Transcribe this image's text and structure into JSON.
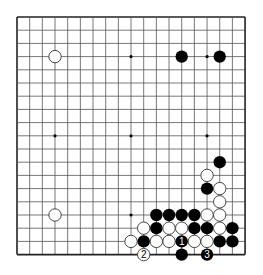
{
  "board": {
    "size": 19,
    "origin_x": 17,
    "origin_y": 17,
    "step_x": 12.67,
    "step_y": 13.2,
    "stone_r": 6.2,
    "line_color": "#555555",
    "border_color": "#222222",
    "black_color": "#000000",
    "white_fill": "#ffffff",
    "white_stroke": "#333333"
  },
  "star_points": [
    [
      3,
      3
    ],
    [
      9,
      3
    ],
    [
      15,
      3
    ],
    [
      3,
      9
    ],
    [
      9,
      9
    ],
    [
      15,
      9
    ],
    [
      3,
      15
    ],
    [
      9,
      15
    ],
    [
      15,
      15
    ]
  ],
  "stones": [
    {
      "color": "white",
      "col": 3,
      "row": 3
    },
    {
      "color": "black",
      "col": 13,
      "row": 3
    },
    {
      "color": "black",
      "col": 16,
      "row": 3
    },
    {
      "color": "black",
      "col": 16,
      "row": 11
    },
    {
      "color": "white",
      "col": 15,
      "row": 12
    },
    {
      "color": "black",
      "col": 15,
      "row": 13
    },
    {
      "color": "white",
      "col": 16,
      "row": 13
    },
    {
      "color": "white",
      "col": 16,
      "row": 14
    },
    {
      "color": "white",
      "col": 3,
      "row": 15
    },
    {
      "color": "black",
      "col": 11,
      "row": 15
    },
    {
      "color": "black",
      "col": 12,
      "row": 15
    },
    {
      "color": "black",
      "col": 13,
      "row": 15
    },
    {
      "color": "black",
      "col": 14,
      "row": 15
    },
    {
      "color": "white",
      "col": 15,
      "row": 15
    },
    {
      "color": "white",
      "col": 16,
      "row": 15
    },
    {
      "color": "white",
      "col": 10,
      "row": 16
    },
    {
      "color": "black",
      "col": 11,
      "row": 16
    },
    {
      "color": "white",
      "col": 12,
      "row": 16
    },
    {
      "color": "white",
      "col": 13,
      "row": 16
    },
    {
      "color": "black",
      "col": 14,
      "row": 16
    },
    {
      "color": "black",
      "col": 15,
      "row": 16
    },
    {
      "color": "white",
      "col": 16,
      "row": 16
    },
    {
      "color": "black",
      "col": 17,
      "row": 16
    },
    {
      "color": "white",
      "col": 9,
      "row": 17
    },
    {
      "color": "black",
      "col": 10,
      "row": 17
    },
    {
      "color": "white",
      "col": 11,
      "row": 17
    },
    {
      "color": "white",
      "col": 12,
      "row": 17
    },
    {
      "color": "black",
      "col": 13,
      "row": 17,
      "label": "1"
    },
    {
      "color": "white",
      "col": 14,
      "row": 17
    },
    {
      "color": "white",
      "col": 15,
      "row": 17
    },
    {
      "color": "black",
      "col": 16,
      "row": 17
    },
    {
      "color": "black",
      "col": 17,
      "row": 17
    },
    {
      "color": "white",
      "col": 10,
      "row": 18,
      "label": "2"
    },
    {
      "color": "black",
      "col": 13,
      "row": 18
    },
    {
      "color": "black",
      "col": 15,
      "row": 18,
      "label": "3"
    }
  ]
}
